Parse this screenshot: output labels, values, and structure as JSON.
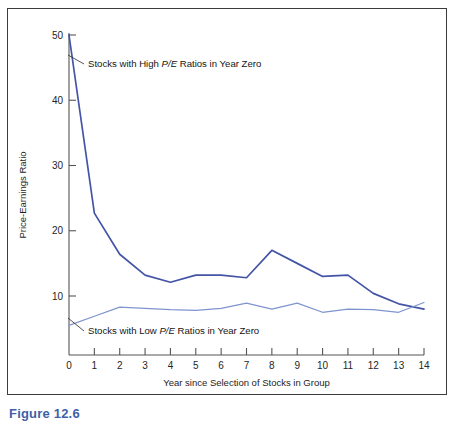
{
  "figure": {
    "caption": "Figure 12.6",
    "caption_color": "#3f5fa8",
    "frame_color": "#3b3b3b",
    "background": "#ffffff"
  },
  "chart_data": {
    "type": "line",
    "title": "",
    "xlabel": "Year since Selection of Stocks in Group",
    "ylabel": "Price-Earnings Ratio",
    "x": [
      0,
      1,
      2,
      3,
      4,
      5,
      6,
      7,
      8,
      9,
      10,
      11,
      12,
      13,
      14
    ],
    "xlim": [
      0,
      14
    ],
    "ylim": [
      0,
      50
    ],
    "xticks": [
      0,
      1,
      2,
      3,
      4,
      5,
      6,
      7,
      8,
      9,
      10,
      11,
      12,
      13,
      14
    ],
    "xtick_labels": [
      "0",
      "1",
      "2",
      "3",
      "4",
      "5",
      "6",
      "7",
      "8",
      "9",
      "10",
      "11",
      "12",
      "13",
      "14"
    ],
    "yticks": [
      10,
      20,
      30,
      40,
      50
    ],
    "ytick_labels": [
      "10",
      "20",
      "30",
      "40",
      "50"
    ],
    "grid": false,
    "legend": "annotations-inline",
    "series": [
      {
        "name": "Stocks with High P/E Ratios in Year Zero",
        "color": "#4454a6",
        "values": [
          50.0,
          22.7,
          16.4,
          13.2,
          12.1,
          13.2,
          13.2,
          12.8,
          17.0,
          15.0,
          13.0,
          13.2,
          10.4,
          8.8,
          8.0
        ]
      },
      {
        "name": "Stocks with Low P/E Ratios in Year Zero",
        "color": "#7e94cf",
        "values": [
          5.5,
          6.9,
          8.3,
          8.1,
          7.9,
          7.8,
          8.1,
          8.9,
          8.0,
          8.9,
          7.5,
          8.0,
          7.9,
          7.5,
          9.0
        ]
      }
    ],
    "annotations": [
      {
        "id": "high-pe-annotation",
        "text_before": "Stocks with High ",
        "text_italic": "P/E",
        "text_after": " Ratios in Year Zero",
        "full_text": "Stocks with High P/E Ratios in Year Zero",
        "text_x": 88,
        "text_y": 67,
        "leader": {
          "x1": 84,
          "y1": 64,
          "x2": 68,
          "y2": 55
        },
        "leader_color": "#2b2b2b"
      },
      {
        "id": "low-pe-annotation",
        "text_before": "Stocks with Low ",
        "text_italic": "P/E",
        "text_after": " Ratios in Year Zero",
        "full_text": "Stocks with Low P/E Ratios in Year Zero",
        "text_x": 88,
        "text_y": 334,
        "leader": {
          "x1": 84,
          "y1": 331,
          "x2": 68,
          "y2": 318
        },
        "leader_color": "#2b2b2b"
      }
    ]
  }
}
